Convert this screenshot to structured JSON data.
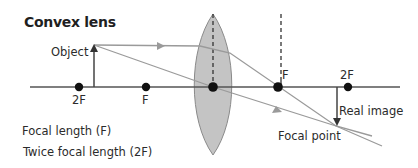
{
  "title": "Convex lens",
  "labels": {
    "object": "Object",
    "left_2f": "2F",
    "left_f": "F",
    "right_f": "F",
    "right_2f": "2F",
    "real_image": "Real image",
    "focal_point": "Focal point"
  },
  "legend": [
    "Focal length (F)",
    "Twice focal length (2F)"
  ],
  "colors": {
    "axis": "#555555",
    "ray": "#9a9a9a",
    "lens_fill": "#c4c4c4",
    "lens_stroke": "#8a8a8a",
    "dot": "#111111",
    "text": "#2b2b2b"
  }
}
